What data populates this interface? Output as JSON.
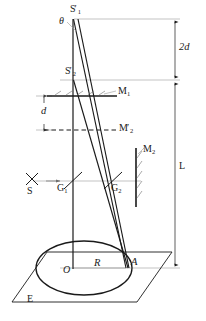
{
  "figure": {
    "type": "optics-ray-diagram",
    "background_color": "#ffffff",
    "line_color": "#1a1a1a",
    "thin_line_color": "#8a8a8a"
  },
  "labels": {
    "source_virtual_1": {
      "base": "S",
      "sub": "1",
      "prime": "′",
      "x": 74,
      "y": 8
    },
    "theta": {
      "text": "θ",
      "x": 62,
      "y": 20
    },
    "source_virtual_2": {
      "base": "S",
      "sub": "2",
      "prime": "′",
      "x": 68,
      "y": 70
    },
    "mirror_1": {
      "base": "M",
      "sub": "1",
      "x": 120,
      "y": 92
    },
    "mirror_2_virtual": {
      "base": "M",
      "sub": "2",
      "prime": "′",
      "x": 121,
      "y": 126
    },
    "mirror_2": {
      "base": "M",
      "sub": "2",
      "x": 145,
      "y": 150
    },
    "source": {
      "base": "S",
      "x": 28,
      "y": 188
    },
    "beamsplitter_1": {
      "base": "G",
      "sub": "1",
      "x": 60,
      "y": 184
    },
    "beamsplitter_2": {
      "base": "G",
      "sub": "2",
      "x": 113,
      "y": 184
    },
    "dim_2d": {
      "text": "2d",
      "x": 172,
      "y": 45
    },
    "dim_d": {
      "text": "d",
      "x": 43,
      "y": 110
    },
    "dim_L": {
      "base": "L",
      "x": 186,
      "y": 165
    },
    "center_O": {
      "text": "O",
      "x": 66,
      "y": 270
    },
    "radius_R": {
      "text": "R",
      "x": 96,
      "y": 263
    },
    "point_A": {
      "text": "A",
      "x": 133,
      "y": 262
    },
    "plane_E": {
      "text": "E",
      "x": 29,
      "y": 298
    }
  },
  "geometry": {
    "axis_x": 72,
    "top_y": 18,
    "plane_y": 268,
    "dim_line_x": 175,
    "s1_point": [
      73,
      19
    ],
    "s2_point": [
      73,
      80
    ],
    "a_point": [
      126,
      268
    ],
    "ellipse": {
      "cx": 84,
      "cy": 268,
      "rx": 48,
      "ry": 27
    },
    "m1_line": {
      "x1": 45,
      "x2": 118,
      "y": 96
    },
    "m2_prime_line": {
      "x1": 42,
      "x2": 118,
      "y": 130
    },
    "m2_mirror": {
      "x": 136,
      "y1": 148,
      "y2": 205
    },
    "beam_axis_y": 181,
    "plane_corners": [
      [
        12,
        302
      ],
      [
        47,
        252
      ],
      [
        172,
        252
      ],
      [
        137,
        302
      ]
    ]
  },
  "dimensions": {
    "width": 206,
    "height": 321
  }
}
